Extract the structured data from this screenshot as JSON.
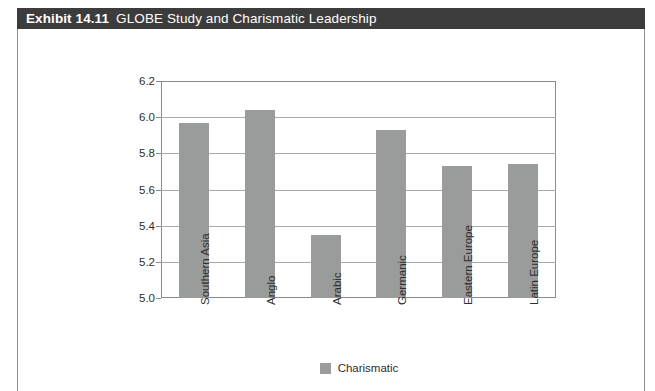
{
  "exhibit": {
    "number": "Exhibit 14.11",
    "title": "GLOBE Study and Charismatic Leadership"
  },
  "colors": {
    "title_bar": "#3c3c3c",
    "title_text": "#ffffff",
    "bar_fill": "#9a9b9b",
    "gridline": "#a9a9a9",
    "frame": "#8a8a8a",
    "panel_border": "#8d8d8d"
  },
  "chart_data": {
    "type": "bar",
    "title": "GLOBE Study and Charismatic Leadership",
    "xlabel": "",
    "ylabel": "",
    "ylim": [
      5.0,
      6.2
    ],
    "ytick_step": 0.2,
    "yticks": [
      "6.2",
      "6.0",
      "5.8",
      "5.6",
      "5.4",
      "5.2",
      "5.0"
    ],
    "grid": true,
    "legend_position": "bottom-center",
    "categories": [
      "Southern Asia",
      "Anglo",
      "Arabic",
      "Germanic",
      "Eastern Europe",
      "Latin Europe"
    ],
    "series": [
      {
        "name": "Charismatic",
        "color": "#9a9b9b",
        "values": [
          5.97,
          6.04,
          5.35,
          5.93,
          5.73,
          5.74
        ]
      }
    ]
  }
}
